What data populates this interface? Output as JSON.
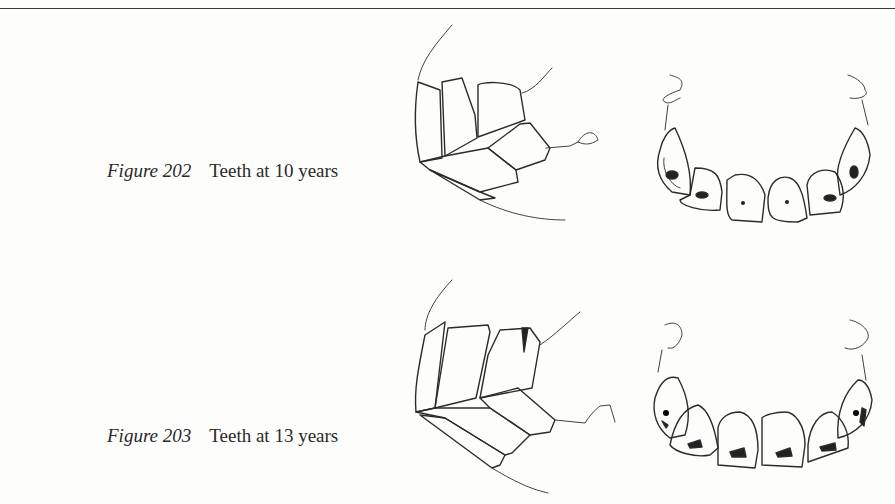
{
  "figures": [
    {
      "number": "Figure 202",
      "caption": "Teeth at 10 years",
      "views": [
        "side-view-incisors",
        "occlusal-view-incisors"
      ]
    },
    {
      "number": "Figure 203",
      "caption": "Teeth at 13 years",
      "views": [
        "side-view-incisors",
        "occlusal-view-incisors"
      ]
    }
  ]
}
